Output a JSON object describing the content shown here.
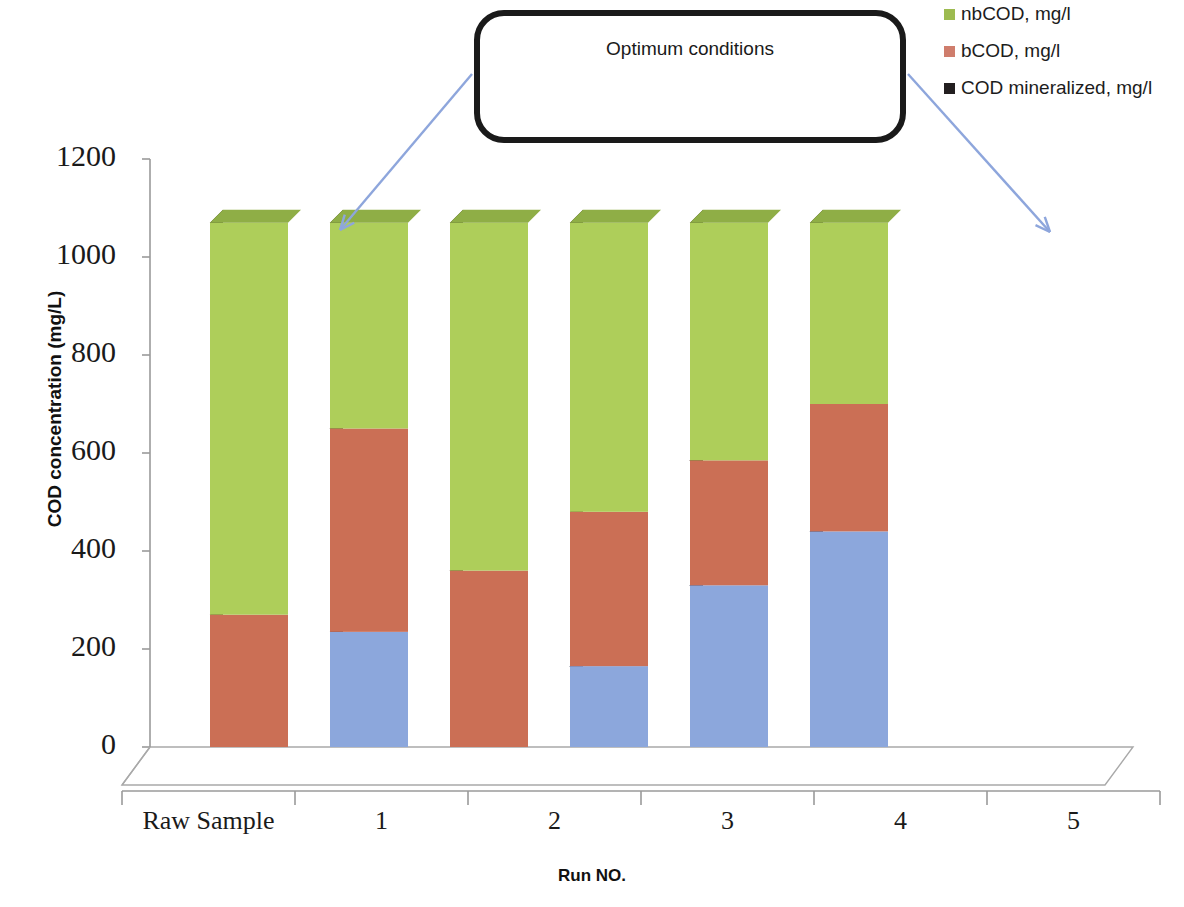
{
  "legend": {
    "position": "top-right",
    "items": [
      {
        "label": "nbCOD, mg/l",
        "color": "#9dbb50",
        "name": "nbcod"
      },
      {
        "label": "bCOD, mg/l",
        "color": "#cf7d6c",
        "name": "bcod"
      },
      {
        "label": "COD mineralized, mg/l",
        "color": "#231f20",
        "name": "cod-mineralized"
      }
    ]
  },
  "callout": {
    "text": "Optimum conditions",
    "border_color": "#1a1a1a",
    "arrow_color": "#8ea6dc",
    "arrow_targets": [
      "1",
      "5"
    ]
  },
  "axes": {
    "y_title": "COD concentration (mg/L)",
    "x_title": "Run NO.",
    "y_ticks": [
      "1200",
      "1000",
      "800",
      "600",
      "400",
      "200",
      "0"
    ],
    "x_ticks": [
      "Raw Sample",
      "1",
      "2",
      "3",
      "4",
      "5"
    ]
  },
  "chart_data": {
    "type": "bar",
    "subtype": "stacked-3d-column",
    "title": "",
    "xlabel": "Run NO.",
    "ylabel": "COD concentration (mg/L)",
    "ylim": [
      0,
      1200
    ],
    "ytick_step": 200,
    "grid": false,
    "legend_position": "top-right",
    "categories": [
      "Raw Sample",
      "1",
      "2",
      "3",
      "4",
      "5"
    ],
    "series": [
      {
        "name": "COD mineralized, mg/l",
        "color": "#8ca7dc",
        "side_color": "#2e3552",
        "top_color": "#6d86bd",
        "values": [
          0,
          235,
          0,
          165,
          330,
          440
        ]
      },
      {
        "name": "bCOD, mg/l",
        "color": "#cb6f55",
        "side_color": "#4a2220",
        "top_color": "#a85a44",
        "values": [
          270,
          415,
          360,
          315,
          255,
          260
        ]
      },
      {
        "name": "nbCOD, mg/l",
        "color": "#aece5a",
        "side_color": "#40431f",
        "top_color": "#8fae46",
        "values": [
          800,
          420,
          710,
          590,
          485,
          370
        ]
      }
    ],
    "totals": [
      1070,
      1070,
      1070,
      1070,
      1070,
      1070
    ],
    "annotations": [
      {
        "text": "Optimum conditions",
        "points_to": [
          "1",
          "5"
        ]
      }
    ]
  }
}
